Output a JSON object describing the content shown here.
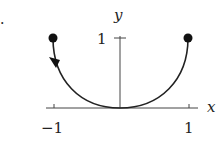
{
  "figure": {
    "marker": ".",
    "axes": {
      "x_label": "x",
      "y_label": "y",
      "x_ticks": [
        {
          "value": -1,
          "label": "−1"
        },
        {
          "value": 1,
          "label": "1"
        }
      ],
      "y_ticks": [
        {
          "value": 1,
          "label": "1"
        }
      ]
    },
    "curve": {
      "description": "U-shaped curve from (1,1) through origin (0,0) to (-1,1)",
      "start_point": [
        1,
        1
      ],
      "end_point": [
        -1,
        1
      ],
      "passes_through": [
        0,
        0
      ],
      "direction_arrow": "near (-1,1), pointing downward along curve",
      "endpoints_marked": true
    },
    "colors": {
      "stroke": "#222222",
      "background": "#ffffff"
    }
  }
}
